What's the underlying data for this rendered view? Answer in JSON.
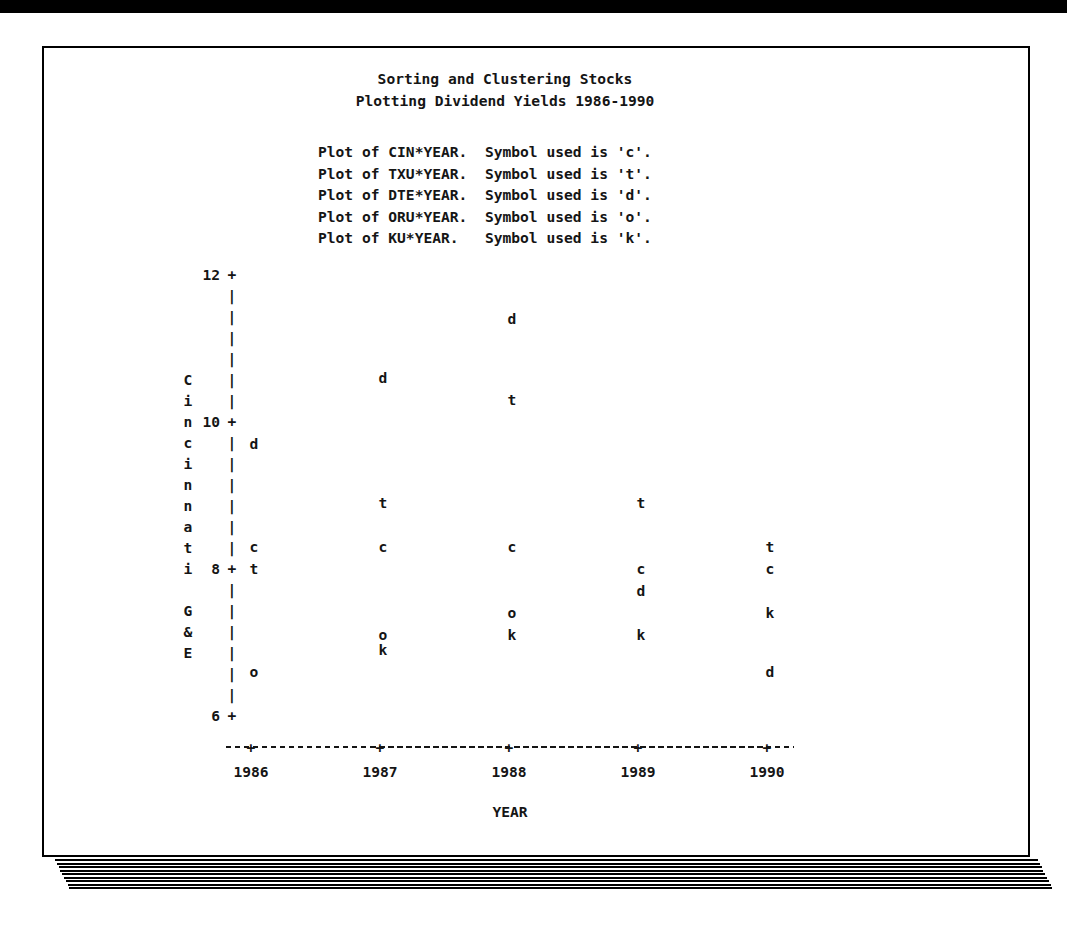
{
  "page": {
    "title_line1": "Sorting and Clustering Stocks",
    "title_line2": "Plotting Dividend Yields 1986-1990"
  },
  "legend": {
    "lines": [
      "Plot of CIN*YEAR.  Symbol used is 'c'.",
      "Plot of TXU*YEAR.  Symbol used is 't'.",
      "Plot of DTE*YEAR.  Symbol used is 'd'.",
      "Plot of ORU*YEAR.  Symbol used is 'o'.",
      "Plot of KU*YEAR.   Symbol used is 'k'."
    ]
  },
  "chart_data": {
    "type": "scatter",
    "xlabel": "YEAR",
    "ylabel": "Cincinnati G&E",
    "x": [
      1986,
      1987,
      1988,
      1989,
      1990
    ],
    "yticks": [
      12,
      10,
      8,
      6
    ],
    "ylim": [
      6,
      12
    ],
    "grid": false,
    "legend_position": "above-plot",
    "series": [
      {
        "name": "CIN",
        "symbol": "c",
        "points": [
          {
            "year": 1986,
            "value": 8.3
          },
          {
            "year": 1987,
            "value": 8.3
          },
          {
            "year": 1988,
            "value": 8.3
          },
          {
            "year": 1989,
            "value": 8.0
          },
          {
            "year": 1990,
            "value": 8.0
          }
        ]
      },
      {
        "name": "TXU",
        "symbol": "t",
        "points": [
          {
            "year": 1986,
            "value": 8.0
          },
          {
            "year": 1987,
            "value": 8.9
          },
          {
            "year": 1988,
            "value": 10.3
          },
          {
            "year": 1989,
            "value": 8.9
          },
          {
            "year": 1990,
            "value": 8.3
          }
        ]
      },
      {
        "name": "DTE",
        "symbol": "d",
        "points": [
          {
            "year": 1986,
            "value": 9.7
          },
          {
            "year": 1987,
            "value": 10.6
          },
          {
            "year": 1988,
            "value": 11.4
          },
          {
            "year": 1989,
            "value": 7.7
          },
          {
            "year": 1990,
            "value": 6.6
          }
        ]
      },
      {
        "name": "ORU",
        "symbol": "o",
        "points": [
          {
            "year": 1986,
            "value": 6.6
          },
          {
            "year": 1987,
            "value": 7.1
          },
          {
            "year": 1988,
            "value": 7.4
          }
        ]
      },
      {
        "name": "KU",
        "symbol": "k",
        "points": [
          {
            "year": 1987,
            "value": 6.9
          },
          {
            "year": 1988,
            "value": 7.1
          },
          {
            "year": 1989,
            "value": 7.1
          },
          {
            "year": 1990,
            "value": 7.4
          }
        ]
      }
    ]
  },
  "colors": {
    "ink": "#151515",
    "paper": "#ffffff",
    "edge": "#000000"
  }
}
